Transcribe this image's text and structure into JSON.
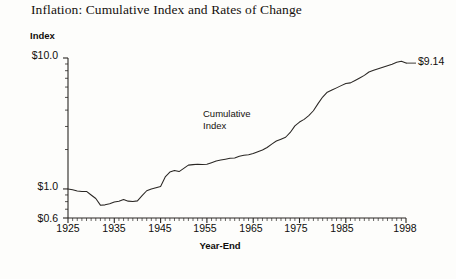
{
  "chart_data": {
    "type": "line",
    "title": "Inflation: Cumulative Index and Rates of Change",
    "xlabel": "Year-End",
    "ylabel": "Index",
    "yscale": "log",
    "ylim": [
      0.6,
      10.0
    ],
    "xlim": [
      1925,
      1998
    ],
    "grid": false,
    "legend_position": "none",
    "y_tick_labels": [
      "$10.0",
      "$1.0",
      "$0.6"
    ],
    "y_tick_values": [
      10.0,
      1.0,
      0.6
    ],
    "x_tick_labels": [
      "1925",
      "1935",
      "1945",
      "1955",
      "1965",
      "1975",
      "1985",
      "1998"
    ],
    "x_tick_values": [
      1925,
      1935,
      1945,
      1955,
      1965,
      1975,
      1985,
      1998
    ],
    "annotations": [
      {
        "text": "Cumulative\nIndex",
        "x": 1957,
        "y": 2.3
      }
    ],
    "end_label": "$9.14",
    "series": [
      {
        "name": "Cumulative Index",
        "color": "#2a2724",
        "x": [
          1925,
          1926,
          1927,
          1928,
          1929,
          1930,
          1931,
          1932,
          1933,
          1934,
          1935,
          1936,
          1937,
          1938,
          1939,
          1940,
          1941,
          1942,
          1943,
          1944,
          1945,
          1946,
          1947,
          1948,
          1949,
          1950,
          1951,
          1952,
          1953,
          1954,
          1955,
          1956,
          1957,
          1958,
          1959,
          1960,
          1961,
          1962,
          1963,
          1964,
          1965,
          1966,
          1967,
          1968,
          1969,
          1970,
          1971,
          1972,
          1973,
          1974,
          1975,
          1976,
          1977,
          1978,
          1979,
          1980,
          1981,
          1982,
          1983,
          1984,
          1985,
          1986,
          1987,
          1988,
          1989,
          1990,
          1991,
          1992,
          1993,
          1994,
          1995,
          1996,
          1997,
          1998
        ],
        "values": [
          1.0,
          0.985,
          0.964,
          0.955,
          0.957,
          0.899,
          0.845,
          0.752,
          0.756,
          0.772,
          0.795,
          0.805,
          0.83,
          0.807,
          0.803,
          0.811,
          0.888,
          0.969,
          1.0,
          1.022,
          1.045,
          1.236,
          1.345,
          1.382,
          1.357,
          1.436,
          1.52,
          1.534,
          1.544,
          1.537,
          1.543,
          1.588,
          1.634,
          1.663,
          1.688,
          1.713,
          1.725,
          1.777,
          1.806,
          1.827,
          1.862,
          1.925,
          1.983,
          2.074,
          2.201,
          2.322,
          2.4,
          2.482,
          2.699,
          3.031,
          3.243,
          3.401,
          3.631,
          3.955,
          4.48,
          5.033,
          5.482,
          5.693,
          5.913,
          6.15,
          6.382,
          6.456,
          6.74,
          7.041,
          7.371,
          7.823,
          8.06,
          8.29,
          8.513,
          8.743,
          8.968,
          9.271,
          9.427,
          9.14
        ]
      }
    ]
  },
  "axes": {
    "y_label": "Index",
    "x_label": "Year-End"
  }
}
